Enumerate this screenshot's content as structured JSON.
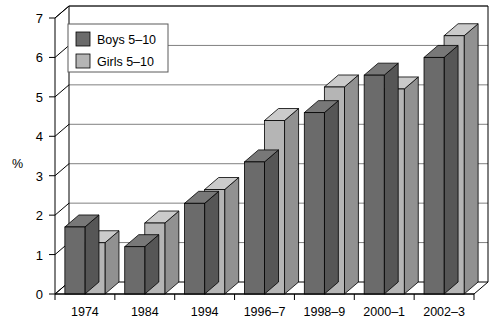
{
  "chart_data": {
    "type": "bar",
    "title": "",
    "subtitle": "",
    "xlabel": "",
    "ylabel": "%",
    "categories": [
      "1974",
      "1984",
      "1994",
      "1996–7",
      "1998–9",
      "2000–1",
      "2002–3"
    ],
    "series": [
      {
        "name": "Boys 5–10",
        "color": "#6b6b6b",
        "values": [
          1.7,
          1.2,
          2.3,
          3.35,
          4.6,
          5.55,
          6.0
        ]
      },
      {
        "name": "Girls 5–10",
        "color": "#b5b5b5",
        "values": [
          1.3,
          1.8,
          2.65,
          4.4,
          5.25,
          5.2,
          6.55
        ]
      }
    ],
    "ylim": [
      0,
      7
    ],
    "yticks": [
      "0",
      "1",
      "2",
      "3",
      "4",
      "5",
      "6",
      "7"
    ],
    "ytick_values": [
      0,
      1,
      2,
      3,
      4,
      5,
      6,
      7
    ],
    "grid": true,
    "grid_axis": "y",
    "legend_position": "top-left",
    "style": "3d-bar",
    "background": "#ffffff",
    "axis_color": "#000000",
    "grid_color": "#808080"
  },
  "legend": {
    "items": [
      {
        "label": "Boys 5–10",
        "swatch": "#6b6b6b"
      },
      {
        "label": "Girls 5–10",
        "swatch": "#b5b5b5"
      }
    ]
  }
}
